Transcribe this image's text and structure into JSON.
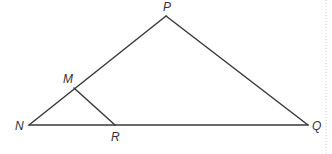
{
  "diagram": {
    "type": "triangle",
    "points": {
      "P": {
        "label": "P",
        "x": 166,
        "y": 16,
        "label_x": 163,
        "label_y": 11
      },
      "N": {
        "label": "N",
        "x": 29,
        "y": 125,
        "label_x": 15,
        "label_y": 130
      },
      "M": {
        "label": "M",
        "x": 74,
        "y": 88,
        "label_x": 63,
        "label_y": 83
      },
      "R": {
        "label": "R",
        "x": 115,
        "y": 125,
        "label_x": 111,
        "label_y": 141
      },
      "Q": {
        "label": "Q",
        "x": 308,
        "y": 125,
        "label_x": 312,
        "label_y": 130
      }
    },
    "segments": [
      {
        "from": "N",
        "to": "P"
      },
      {
        "from": "P",
        "to": "Q"
      },
      {
        "from": "N",
        "to": "Q"
      },
      {
        "from": "M",
        "to": "R"
      }
    ],
    "line_color": "#3a3a3a",
    "label_color": "#333333",
    "right_border_x": 326
  }
}
